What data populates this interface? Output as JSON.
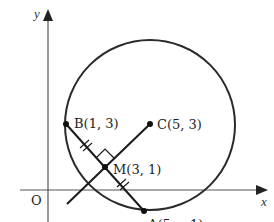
{
  "diagram": {
    "type": "coordinate-geometry",
    "axes": {
      "x_label": "x",
      "y_label": "y",
      "origin_label": "O"
    },
    "circle": {
      "center_label": "C(5, 3)",
      "center": [
        5,
        3
      ]
    },
    "points": [
      {
        "id": "B",
        "label": "B(1, 3)",
        "coords": [
          1,
          3
        ]
      },
      {
        "id": "C",
        "label": "C(5, 3)",
        "coords": [
          5,
          3
        ]
      },
      {
        "id": "M",
        "label": "M(3, 1)",
        "coords": [
          3,
          1
        ]
      },
      {
        "id": "A",
        "label": "A(5, −1)",
        "coords": [
          5,
          -1
        ]
      }
    ],
    "segments": [
      {
        "from": "B",
        "to": "A",
        "note": "chord with equal-length tick marks on BM and MA"
      },
      {
        "from": "C",
        "to": "M",
        "note": "perpendicular bisector, extended beyond M"
      }
    ],
    "marks": {
      "right_angle_at": "M",
      "equal_ticks": "double ticks on BM and MA"
    },
    "colors": {
      "stroke": "#2a2a2a",
      "axis": "#555555",
      "background": "#ffffff"
    }
  }
}
